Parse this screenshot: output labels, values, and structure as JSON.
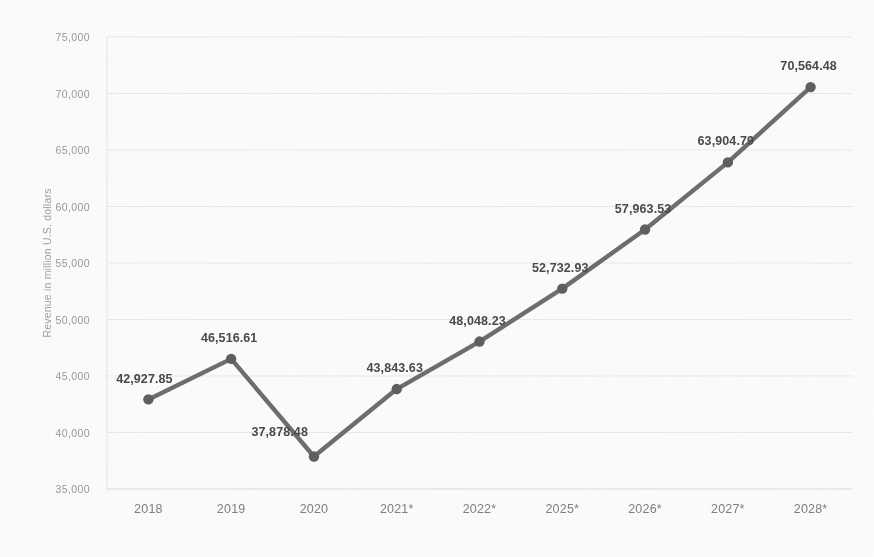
{
  "chart_data": {
    "type": "line",
    "title": "",
    "xlabel": "",
    "ylabel": "Revenue in million U.S. dollars",
    "categories": [
      "2018",
      "2019",
      "2020",
      "2021*",
      "2022*",
      "2025*",
      "2026*",
      "2027*",
      "2028*"
    ],
    "values": [
      42927.85,
      46516.61,
      37878.48,
      43843.63,
      48048.23,
      52732.93,
      57963.53,
      63904.79,
      70564.48
    ],
    "point_labels": [
      "42,927.85",
      "46,516.61",
      "37,878.48",
      "43,843.63",
      "48,048.23",
      "52,732.93",
      "57,963.53",
      "63,904.79",
      "70,564.48"
    ],
    "ylim": [
      35000,
      75000
    ],
    "ytick_values": [
      35000,
      40000,
      45000,
      50000,
      55000,
      60000,
      65000,
      70000,
      75000
    ],
    "ytick_labels": [
      "35,000",
      "40,000",
      "45,000",
      "50,000",
      "55,000",
      "60,000",
      "65,000",
      "70,000",
      "75,000"
    ],
    "grid": true,
    "legend": "none",
    "series": [
      {
        "name": "Revenue",
        "values": [
          42927.85,
          46516.61,
          37878.48,
          43843.63,
          48048.23,
          52732.93,
          57963.53,
          63904.79,
          70564.48
        ]
      }
    ],
    "colors": {
      "line": "#6e6e6e",
      "marker": "#5f5f5f",
      "grid": "#e9e9e9",
      "value_label": "#4a4a4a",
      "tick_label": "#8c8c8c",
      "background": "#fcfcfc"
    }
  }
}
